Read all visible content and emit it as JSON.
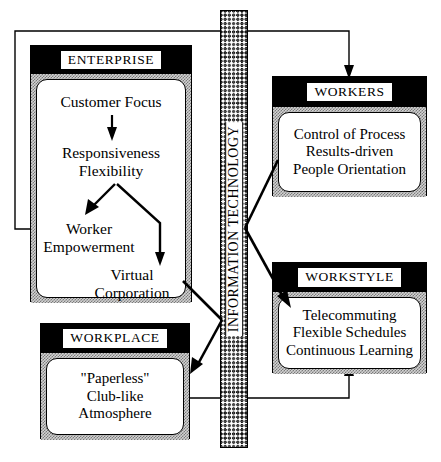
{
  "diagram": {
    "center_bar": {
      "label": "INFORMATION TECHNOLOGY",
      "pattern": "zigzag-hatch",
      "orientation": "vertical"
    },
    "modules": [
      {
        "id": "enterprise",
        "title": "ENTERPRISE",
        "lines": [
          "Customer Focus",
          "Responsiveness",
          "Flexibility",
          "Worker",
          "Empowerment",
          "Virtual",
          "Corporation"
        ],
        "items": [
          {
            "key": "customer_focus",
            "text": "Customer Focus"
          },
          {
            "key": "responsiveness",
            "text": "Responsiveness"
          },
          {
            "key": "flexibility",
            "text": "Flexibility"
          },
          {
            "key": "worker",
            "text": "Worker"
          },
          {
            "key": "empowerment",
            "text": "Empowerment"
          },
          {
            "key": "virtual",
            "text": "Virtual"
          },
          {
            "key": "corporation",
            "text": "Corporation"
          }
        ]
      },
      {
        "id": "workers",
        "title": "WORKERS",
        "lines": [
          "Control of Process",
          "Results-driven",
          "People Orientation"
        ]
      },
      {
        "id": "workstyle",
        "title": "WORKSTYLE",
        "lines": [
          "Telecommuting",
          "Flexible Schedules",
          "Continuous Learning"
        ]
      },
      {
        "id": "workplace",
        "title": "WORKPLACE",
        "lines": [
          "\"Paperless\"",
          "Club-like",
          "Atmosphere"
        ]
      }
    ],
    "connections": [
      {
        "from": "workers",
        "to": "enterprise",
        "style": "thin-orthogonal-feedback",
        "side": "top-left"
      },
      {
        "from": "enterprise",
        "to": "workers",
        "style": "thin-orthogonal-feedback",
        "side": "top-right"
      },
      {
        "from": "enterprise",
        "to": "info-technology",
        "style": "thick-diagonal"
      },
      {
        "from": "info-technology",
        "to": "workplace",
        "style": "thick-diagonal-arrow"
      },
      {
        "from": "workers",
        "to": "info-technology",
        "style": "thick-diagonal"
      },
      {
        "from": "info-technology",
        "to": "workstyle",
        "style": "thick-diagonal-arrow"
      },
      {
        "from": "workplace",
        "to": "workstyle",
        "style": "thin-orthogonal-arrow",
        "side": "bottom"
      },
      {
        "from": "customer_focus",
        "to": "responsiveness",
        "style": "internal-arrow-down"
      },
      {
        "from": "flexibility",
        "to": "worker_empowerment",
        "style": "internal-arrow-diagonal"
      },
      {
        "from": "flexibility",
        "to": "virtual_corporation",
        "style": "internal-arrow-elbow"
      }
    ],
    "colors": {
      "ink": "#000000",
      "paper": "#ffffff",
      "frame_fill": "#d2d2d2",
      "header_fill": "#000000"
    }
  }
}
